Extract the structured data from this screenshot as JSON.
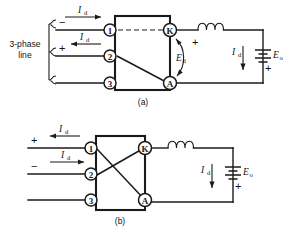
{
  "figure": {
    "background_color": "#ffffff",
    "line_color": "#1a1a1a"
  },
  "panels": [
    {
      "id": "a",
      "caption": "(a)",
      "source_label_line1": "3-phase",
      "source_label_line2": "line",
      "has_source_bracket": true,
      "ac_lines": [
        {
          "terminal": "1",
          "polarity": "−",
          "current_label": "I",
          "current_sub": "d",
          "current_direction": "right"
        },
        {
          "terminal": "2",
          "polarity": "+",
          "current_label": "I",
          "current_sub": "d",
          "current_direction": "left"
        },
        {
          "terminal": "3",
          "polarity": "",
          "current_label": "",
          "current_sub": "",
          "current_direction": "none"
        }
      ],
      "dc_terminals": [
        {
          "id": "K",
          "name": "cathode-terminal"
        },
        {
          "id": "A",
          "name": "anode-terminal"
        }
      ],
      "internal_connections": [
        {
          "from": "1",
          "to": "K",
          "style": "dashed"
        },
        {
          "from": "2",
          "to": "A",
          "style": "solid"
        }
      ],
      "bridge_voltage": {
        "label": "E",
        "sub": "d",
        "polarity": "+",
        "polarity_position": "top"
      },
      "inductor": {
        "name": "smoothing-inductor",
        "turns": 3
      },
      "dc_current": {
        "label": "I",
        "sub": "d",
        "direction": "down"
      },
      "battery": {
        "label": "E",
        "sub": "o",
        "polarity": "+",
        "polarity_position": "bottom"
      }
    },
    {
      "id": "b",
      "caption": "(b)",
      "source_label_line1": "",
      "source_label_line2": "",
      "has_source_bracket": false,
      "ac_lines": [
        {
          "terminal": "1",
          "polarity": "+",
          "current_label": "I",
          "current_sub": "d",
          "current_direction": "left"
        },
        {
          "terminal": "2",
          "polarity": "−",
          "current_label": "I",
          "current_sub": "d",
          "current_direction": "right"
        },
        {
          "terminal": "3",
          "polarity": "",
          "current_label": "",
          "current_sub": "",
          "current_direction": "none"
        }
      ],
      "dc_terminals": [
        {
          "id": "K",
          "name": "cathode-terminal"
        },
        {
          "id": "A",
          "name": "anode-terminal"
        }
      ],
      "internal_connections": [
        {
          "from": "1",
          "to": "A",
          "style": "solid"
        },
        {
          "from": "2",
          "to": "K",
          "style": "solid"
        }
      ],
      "bridge_voltage": null,
      "inductor": {
        "name": "smoothing-inductor",
        "turns": 3
      },
      "dc_current": {
        "label": "I",
        "sub": "d",
        "direction": "down"
      },
      "battery": {
        "label": "E",
        "sub": "o",
        "polarity": "+",
        "polarity_position": "bottom"
      }
    }
  ]
}
